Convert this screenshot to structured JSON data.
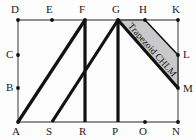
{
  "figure": {
    "annotation": "Trapezoid CHLM",
    "colors": {
      "thin_line": "#6e6e6e",
      "thick_line": "#111111",
      "shade_fill": "#c9c9c9",
      "shade_stroke": "#111111",
      "label": "#1a1a1a",
      "background": "#fdfdfd"
    },
    "vertices": [
      {
        "id": "D",
        "label": "D",
        "x": 18,
        "y": 20,
        "lx": 11,
        "ly": 13,
        "dot": true
      },
      {
        "id": "E",
        "label": "E",
        "x": 52,
        "y": 20,
        "lx": 46,
        "ly": 13,
        "dot": true
      },
      {
        "id": "F",
        "label": "F",
        "x": 85,
        "y": 20,
        "lx": 79,
        "ly": 13,
        "dot": true
      },
      {
        "id": "G",
        "label": "G",
        "x": 118,
        "y": 20,
        "lx": 112,
        "ly": 13,
        "dot": true
      },
      {
        "id": "H",
        "label": "H",
        "x": 145,
        "y": 20,
        "lx": 139,
        "ly": 13,
        "dot": true
      },
      {
        "id": "K",
        "label": "K",
        "x": 178,
        "y": 20,
        "lx": 172,
        "ly": 13,
        "dot": true
      },
      {
        "id": "C",
        "label": "C",
        "x": 18,
        "y": 55,
        "lx": 6,
        "ly": 58,
        "dot": true
      },
      {
        "id": "L",
        "label": "L",
        "x": 178,
        "y": 55,
        "lx": 183,
        "ly": 58,
        "dot": true
      },
      {
        "id": "B",
        "label": "B",
        "x": 18,
        "y": 88,
        "lx": 6,
        "ly": 91,
        "dot": true
      },
      {
        "id": "M",
        "label": "M",
        "x": 178,
        "y": 88,
        "lx": 183,
        "ly": 92,
        "dot": true
      },
      {
        "id": "A",
        "label": "A",
        "x": 18,
        "y": 122,
        "lx": 12,
        "ly": 135,
        "dot": true
      },
      {
        "id": "S",
        "label": "S",
        "x": 52,
        "y": 122,
        "lx": 46,
        "ly": 135,
        "dot": false
      },
      {
        "id": "R",
        "label": "R",
        "x": 85,
        "y": 122,
        "lx": 79,
        "ly": 135,
        "dot": false
      },
      {
        "id": "P",
        "label": "P",
        "x": 118,
        "y": 122,
        "lx": 112,
        "ly": 135,
        "dot": false
      },
      {
        "id": "O",
        "label": "O",
        "x": 145,
        "y": 122,
        "lx": 139,
        "ly": 135,
        "dot": true
      },
      {
        "id": "N",
        "label": "N",
        "x": 178,
        "y": 122,
        "lx": 172,
        "ly": 135,
        "dot": true
      }
    ],
    "thin_segments": [
      {
        "name": "top-edge-DK",
        "x1": 18,
        "y1": 20,
        "x2": 178,
        "y2": 20
      },
      {
        "name": "bottom-edge-AN",
        "x1": 18,
        "y1": 122,
        "x2": 178,
        "y2": 122
      },
      {
        "name": "left-edge-DA",
        "x1": 18,
        "y1": 20,
        "x2": 18,
        "y2": 122
      },
      {
        "name": "right-edge-KN",
        "x1": 178,
        "y1": 20,
        "x2": 178,
        "y2": 122
      }
    ],
    "thick_segments": [
      {
        "name": "diagonal-AF",
        "x1": 18,
        "y1": 122,
        "x2": 85,
        "y2": 20
      },
      {
        "name": "vertical-FR",
        "x1": 85,
        "y1": 20,
        "x2": 85,
        "y2": 122
      },
      {
        "name": "diagonal-SG",
        "x1": 52,
        "y1": 122,
        "x2": 118,
        "y2": 20
      },
      {
        "name": "vertical-GP",
        "x1": 118,
        "y1": 20,
        "x2": 118,
        "y2": 122
      },
      {
        "name": "diagonal-GM",
        "x1": 118,
        "y1": 20,
        "x2": 178,
        "y2": 88
      }
    ],
    "shaded_region": {
      "name": "trapezoid-CHLM",
      "points": "118,20 145,20 178,55 178,88"
    }
  }
}
